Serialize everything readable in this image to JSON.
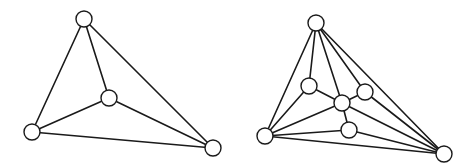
{
  "figure": {
    "colors": {
      "background": "#ffffff",
      "stroke": "#1a1a1a",
      "node_fill": "#ffffff"
    },
    "node_radius": 8,
    "graphs": [
      {
        "name": "left-graph",
        "nodes": [
          {
            "id": "top",
            "x": 84,
            "y": 19
          },
          {
            "id": "center",
            "x": 109,
            "y": 98
          },
          {
            "id": "left",
            "x": 32,
            "y": 132
          },
          {
            "id": "right",
            "x": 213,
            "y": 148
          }
        ],
        "edges": [
          [
            "top",
            "left"
          ],
          [
            "top",
            "center"
          ],
          [
            "top",
            "right"
          ],
          [
            "center",
            "left"
          ],
          [
            "center",
            "right"
          ],
          [
            "left",
            "right"
          ]
        ]
      },
      {
        "name": "right-graph",
        "nodes": [
          {
            "id": "top",
            "x": 316,
            "y": 23
          },
          {
            "id": "inner-left",
            "x": 309,
            "y": 86
          },
          {
            "id": "center",
            "x": 342,
            "y": 103
          },
          {
            "id": "inner-right",
            "x": 365,
            "y": 92
          },
          {
            "id": "lower",
            "x": 349,
            "y": 130
          },
          {
            "id": "bottom-left",
            "x": 265,
            "y": 136
          },
          {
            "id": "bottom-right",
            "x": 444,
            "y": 154
          }
        ],
        "edges": [
          [
            "top",
            "bottom-left"
          ],
          [
            "top",
            "inner-left"
          ],
          [
            "top",
            "center"
          ],
          [
            "top",
            "inner-right"
          ],
          [
            "top",
            "bottom-right"
          ],
          [
            "inner-left",
            "center"
          ],
          [
            "inner-left",
            "bottom-left"
          ],
          [
            "center",
            "inner-right"
          ],
          [
            "center",
            "lower"
          ],
          [
            "center",
            "bottom-left"
          ],
          [
            "center",
            "bottom-right"
          ],
          [
            "inner-right",
            "bottom-right"
          ],
          [
            "lower",
            "bottom-left"
          ],
          [
            "lower",
            "bottom-right"
          ],
          [
            "bottom-left",
            "bottom-right"
          ]
        ]
      }
    ]
  }
}
